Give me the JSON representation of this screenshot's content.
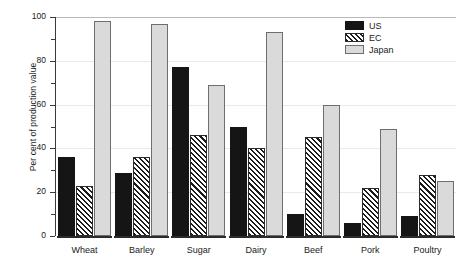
{
  "chart_data": {
    "type": "bar",
    "title": "",
    "xlabel": "",
    "ylabel": "Per cent of production value",
    "ylim": [
      0,
      100
    ],
    "yticks": [
      0,
      20,
      40,
      60,
      80,
      100
    ],
    "ytick_labels": [
      "0",
      "20",
      "40",
      "60",
      "80",
      "100"
    ],
    "minor_yticks": [
      10,
      30,
      50,
      70,
      90
    ],
    "grid": true,
    "legend_position": "upper-center-right",
    "categories": [
      "Wheat",
      "Barley",
      "Sugar",
      "Dairy",
      "Beef",
      "Pork",
      "Poultry"
    ],
    "series": [
      {
        "name": "US",
        "color": "#151515",
        "pattern": "solid",
        "values": [
          36,
          29,
          77,
          50,
          10,
          6,
          9
        ]
      },
      {
        "name": "EC",
        "color": "#1b1b1b",
        "pattern": "diagonal-hatch",
        "values": [
          23,
          36,
          46,
          40,
          45,
          22,
          28
        ]
      },
      {
        "name": "Japan",
        "color": "#dadada",
        "pattern": "light-fill",
        "values": [
          98,
          97,
          69,
          93,
          60,
          49,
          25
        ]
      }
    ]
  },
  "legend": {
    "items": [
      {
        "label": "US"
      },
      {
        "label": "EC"
      },
      {
        "label": "Japan"
      }
    ]
  }
}
